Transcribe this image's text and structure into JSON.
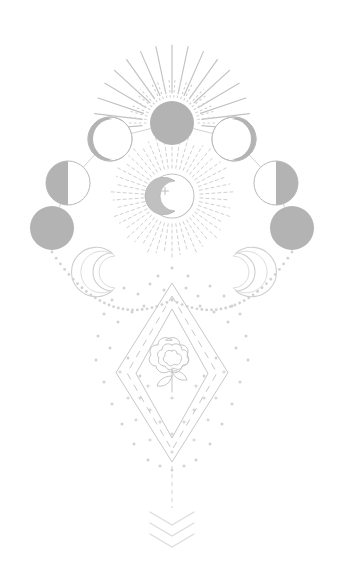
{
  "artwork": {
    "title": "Celestial Moon Phases with Rose Diamond Talisman",
    "style": "line-art illustration",
    "background_color": "#ffffff",
    "canvas": {
      "width": 344,
      "height": 583
    },
    "palette": {
      "moon_fill": "#b3b3b3",
      "moon_fill_light": "#c9c9c9",
      "stroke_primary": "#b9b9b9",
      "stroke_soft": "#cfcfcf",
      "stroke_faint": "#dddddd",
      "rose_stroke": "#c4c4c4",
      "diamond_stroke": "#c8c8c8",
      "star_fill": "#d6d6d6",
      "dot_fill": "#d2d2d2",
      "chevron_stroke": "#dcdcdc"
    }
  },
  "elements": {
    "top_sunburst": {
      "name": "top-sunburst",
      "center": {
        "x": 172,
        "y": 123
      },
      "disc_radius": 22,
      "long_rays": {
        "count": 17,
        "inner_radius": 30,
        "outer_radius": 78,
        "spread_degrees": 190,
        "style": "solid"
      },
      "short_rays": {
        "count": 24,
        "inner_radius": 26,
        "outer_radius": 46,
        "spread_degrees": 180,
        "style": "dotted"
      }
    },
    "center_sunburst": {
      "name": "center-moon-sunburst",
      "center": {
        "x": 172,
        "y": 196
      },
      "disc_radius": 22,
      "ray_count": 46,
      "ray_inner_radius": 28,
      "ray_outer_radius": 56,
      "ray_style": "dashed",
      "crescent": {
        "outer_radius": 15,
        "offset_x": 6
      },
      "sparkle": {
        "x": 165,
        "y": 191,
        "size": 6
      }
    },
    "moon_phase_arc": {
      "name": "moon-phase-arc",
      "phases": [
        {
          "id": "phase-new-left",
          "label": "New Moon",
          "cx": 52,
          "cy": 228,
          "r": 22,
          "type": "full"
        },
        {
          "id": "phase-first-quarter-left",
          "label": "Quarter Moon",
          "cx": 68,
          "cy": 183,
          "r": 22,
          "type": "half-left"
        },
        {
          "id": "phase-crescent-left",
          "label": "Crescent Moon",
          "cx": 110,
          "cy": 139,
          "r": 22,
          "type": "crescent-left"
        },
        {
          "id": "phase-full-top",
          "label": "Full Moon",
          "cx": 172,
          "cy": 123,
          "r": 22,
          "type": "full"
        },
        {
          "id": "phase-crescent-right",
          "label": "Crescent Moon",
          "cx": 234,
          "cy": 139,
          "r": 22,
          "type": "crescent-right"
        },
        {
          "id": "phase-last-quarter-right",
          "label": "Quarter Moon",
          "cx": 276,
          "cy": 183,
          "r": 22,
          "type": "half-right"
        },
        {
          "id": "phase-new-right",
          "label": "New Moon",
          "cx": 292,
          "cy": 228,
          "r": 22,
          "type": "full"
        }
      ],
      "connector_style": "thin solid line"
    },
    "side_crescents": [
      {
        "id": "crescent-left",
        "label": "Left Crescent Moon",
        "cx": 108,
        "cy": 272,
        "r": 19,
        "facing": "right"
      },
      {
        "id": "crescent-right",
        "label": "Right Crescent Moon",
        "cx": 240,
        "cy": 272,
        "r": 19,
        "facing": "left"
      }
    ],
    "dotted_swags": {
      "name": "dotted-swag-arcs",
      "left": {
        "from": {
          "x": 52,
          "y": 252
        },
        "to": {
          "x": 172,
          "y": 300
        }
      },
      "right": {
        "from": {
          "x": 292,
          "y": 252
        },
        "to": {
          "x": 172,
          "y": 300
        }
      },
      "dot_radius": 1.4
    },
    "diamond_stack": {
      "name": "nested-diamond-frame",
      "center": {
        "x": 172,
        "y": 372
      },
      "layers": [
        {
          "id": "diamond-outer",
          "half_width": 56,
          "top_y": 283,
          "bottom_y": 462,
          "style": "solid"
        },
        {
          "id": "diamond-middle",
          "half_width": 45,
          "top_y": 296,
          "bottom_y": 450,
          "style": "dashed"
        },
        {
          "id": "diamond-inner",
          "half_width": 36,
          "top_y": 309,
          "bottom_y": 438,
          "style": "solid"
        }
      ]
    },
    "rose": {
      "name": "rose-motif",
      "center": {
        "x": 172,
        "y": 352
      },
      "bloom_radius": 17,
      "stem_length": 34,
      "leaf_count": 2
    },
    "star_field": {
      "name": "star-field",
      "star_glyph": "four-point-star",
      "star_count": 22,
      "dot_count": 44
    },
    "tail": {
      "name": "tail-ornament",
      "dashed_line": {
        "x": 172,
        "from_y": 466,
        "to_y": 508
      },
      "chevrons": {
        "count": 3,
        "start_y": 512,
        "spacing": 11,
        "half_width": 22,
        "drop": 13
      }
    }
  }
}
